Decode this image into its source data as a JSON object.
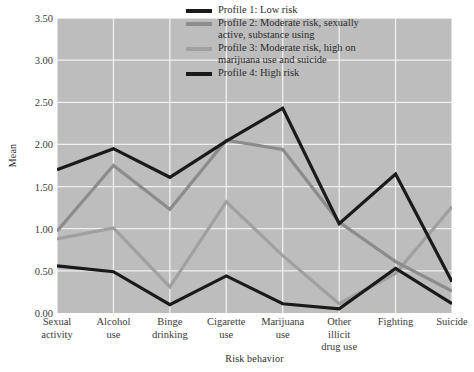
{
  "chart_data": {
    "type": "line",
    "title": "",
    "xlabel": "Risk behavior",
    "ylabel": "Mean",
    "ylim": [
      0.0,
      3.5
    ],
    "ytick_labels": [
      "0.00",
      "0.50",
      "1.00",
      "1.50",
      "2.00",
      "2.50",
      "3.00",
      "3.50"
    ],
    "ytick_values": [
      0.0,
      0.5,
      1.0,
      1.5,
      2.0,
      2.5,
      3.0,
      3.5
    ],
    "grid": true,
    "legend_position": "top-right",
    "plot_background": "#bdbdbd",
    "gridline_color": "#f0f0f0",
    "categories": [
      "Sexual\nactivity",
      "Alcohol\nuse",
      "Binge\ndrinking",
      "Cigarette\nuse",
      "Marijuana\nuse",
      "Other\nillicit\ndrug use",
      "Fighting",
      "Suicide"
    ],
    "series": [
      {
        "name": "Profile 1: Low risk",
        "color": "#1a1a1a",
        "values": [
          0.56,
          0.49,
          0.1,
          0.44,
          0.11,
          0.05,
          0.53,
          0.11
        ]
      },
      {
        "name": "Profile 2: Moderate risk, sexually\nactive, substance using",
        "color": "#8c8c8c",
        "values": [
          0.97,
          1.75,
          1.23,
          2.05,
          1.94,
          1.08,
          0.61,
          0.26
        ]
      },
      {
        "name": "Profile 3: Moderate risk, high on\nmarijuana use and suicide",
        "color": "#a0a0a0",
        "values": [
          0.88,
          1.01,
          0.31,
          1.32,
          0.68,
          0.11,
          0.47,
          1.26
        ]
      },
      {
        "name": "Profile 4: High risk",
        "color": "#1a1a1a",
        "values": [
          1.7,
          1.95,
          1.61,
          2.04,
          2.43,
          1.06,
          1.65,
          0.37
        ]
      }
    ]
  },
  "legend": {
    "items": [
      {
        "label": "Profile 1: Low risk",
        "color": "#1a1a1a"
      },
      {
        "label": "Profile 2: Moderate risk, sexually\nactive, substance using",
        "color": "#8c8c8c"
      },
      {
        "label": "Profile 3: Moderate risk, high on\nmarijuana use and suicide",
        "color": "#a0a0a0"
      },
      {
        "label": "Profile 4: High risk",
        "color": "#1a1a1a"
      }
    ]
  }
}
